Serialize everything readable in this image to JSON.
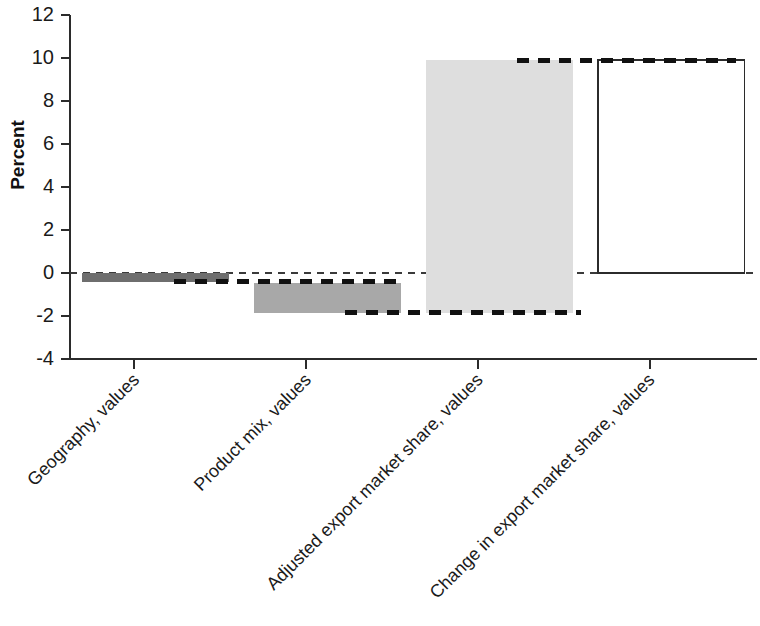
{
  "chart_data": {
    "type": "bar",
    "subtype": "waterfall",
    "title": "",
    "xlabel": "",
    "ylabel": "Percent",
    "ylim": [
      -4,
      12
    ],
    "ytick_labels": [
      "12",
      "10",
      "8",
      "6",
      "4",
      "2",
      "0",
      "-2",
      "-4"
    ],
    "yticks": [
      12,
      10,
      8,
      6,
      4,
      2,
      0,
      -2,
      -4
    ],
    "grid": false,
    "legend": "none",
    "zero_reference_line": true,
    "connector_lines": true,
    "categories": [
      "Geography, values",
      "Product mix, values",
      "Adjusted export market share, values",
      "Change in export market share, values"
    ],
    "values": [
      -0.4,
      -1.4,
      11.75,
      9.9
    ],
    "bars": [
      {
        "label": "Geography, values",
        "base": 0,
        "top": -0.4,
        "delta": -0.4,
        "fill": "#6e6e6e",
        "style": "solid-dark-gray",
        "is_total": false
      },
      {
        "label": "Product mix, values",
        "base": -0.45,
        "top": -1.85,
        "delta": -1.4,
        "fill": "#a8a8a8",
        "style": "solid-medium-gray",
        "is_total": false
      },
      {
        "label": "Adjusted export market share, values",
        "base": -1.85,
        "top": 9.9,
        "delta": 11.75,
        "fill": "#dedede",
        "style": "solid-light-gray",
        "is_total": false
      },
      {
        "label": "Change in export market share, values",
        "base": 0,
        "top": 9.9,
        "delta": 9.9,
        "fill": "#ffffff",
        "style": "outlined-white",
        "is_total": true
      }
    ]
  },
  "colors": {
    "axis": "#2b2b2b",
    "text": "#1a1a1a",
    "bar_dark": "#6e6e6e",
    "bar_medium": "#a8a8a8",
    "bar_light": "#dedede",
    "bar_total": "#ffffff",
    "connector": "#111111",
    "zero_line": "#3a3a3a",
    "background": "#ffffff"
  }
}
